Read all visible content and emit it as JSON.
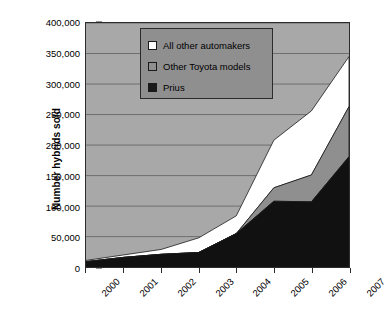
{
  "chart_data": {
    "type": "area",
    "title": "",
    "subtitle": "",
    "xlabel": "",
    "ylabel": "Number hybrids sold",
    "stacked": true,
    "grid": true,
    "legend_position": "top-center-inside",
    "categories": [
      "2000",
      "2001",
      "2002",
      "2003",
      "2004",
      "2005",
      "2006",
      "2007"
    ],
    "x": [
      2000,
      2001,
      2002,
      2003,
      2004,
      2005,
      2006,
      2007
    ],
    "ylim": [
      0,
      400000
    ],
    "ytick_values": [
      0,
      50000,
      100000,
      150000,
      200000,
      250000,
      300000,
      350000,
      400000
    ],
    "ytick_labels": [
      "0",
      "50,000",
      "100,000",
      "150,000",
      "200,000",
      "250,000",
      "300,000",
      "350,000",
      "400,000"
    ],
    "series": [
      {
        "name": "Prius",
        "color": "#111111",
        "values": [
          9000,
          16000,
          21000,
          24000,
          55000,
          108000,
          107000,
          181000
        ]
      },
      {
        "name": "Other Toyota models",
        "color": "#8f8f8f",
        "values": [
          0,
          0,
          0,
          0,
          0,
          22000,
          44000,
          82000
        ]
      },
      {
        "name": "All other automakers",
        "color": "#ffffff",
        "values": [
          2000,
          4000,
          8000,
          24000,
          29000,
          78000,
          105000,
          82000
        ]
      }
    ],
    "cumulative_totals": [
      11000,
      20000,
      29000,
      48000,
      84000,
      208000,
      256000,
      345000
    ],
    "prius_plus_toyota": [
      9000,
      16000,
      21000,
      24000,
      55000,
      130000,
      151000,
      263000
    ],
    "colors": {
      "plot_background": "#a8a8a8",
      "legend_background": "#8f8f8f",
      "axis": "#2b2b2b",
      "gridline": "#6e6e6e",
      "prius": "#111111",
      "other_toyota": "#8f8f8f",
      "all_other": "#ffffff"
    }
  },
  "legend": {
    "items": [
      {
        "label": "All other automakers",
        "swatch": "#ffffff"
      },
      {
        "label": "Other Toyota models",
        "swatch": "#8f8f8f"
      },
      {
        "label": "Prius",
        "swatch": "#1a1a1a"
      }
    ]
  },
  "axes": {
    "y_title": "Number hybrids sold"
  }
}
